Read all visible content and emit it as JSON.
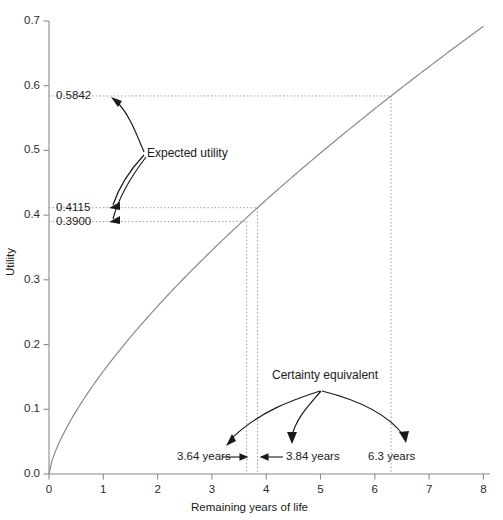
{
  "chart_data": {
    "type": "line",
    "title": "",
    "xlabel": "Remaining years of life",
    "ylabel": "Utility",
    "xlim": [
      0,
      8
    ],
    "ylim": [
      0,
      0.7
    ],
    "grid": false,
    "legend": "none",
    "xticks": [
      "0",
      "1",
      "2",
      "3",
      "4",
      "5",
      "6",
      "7",
      "8"
    ],
    "xtick_values": [
      0,
      1,
      2,
      3,
      4,
      5,
      6,
      7,
      8
    ],
    "yticks": [
      "0.0",
      "0.1",
      "0.2",
      "0.3",
      "0.4",
      "0.5",
      "0.6",
      "0.7"
    ],
    "ytick_values": [
      0.0,
      0.1,
      0.2,
      0.3,
      0.4,
      0.5,
      0.6,
      0.7
    ],
    "series": [
      {
        "name": "Utility curve",
        "x": [
          0.0,
          0.25,
          0.5,
          0.75,
          1.0,
          1.5,
          2.0,
          2.5,
          3.0,
          3.5,
          3.64,
          3.84,
          4.0,
          4.5,
          5.0,
          5.5,
          6.0,
          6.3,
          6.5,
          7.0,
          7.5,
          8.0
        ],
        "y": [
          0.0,
          0.0185,
          0.0365,
          0.054,
          0.071,
          0.1035,
          0.1345,
          0.164,
          0.1925,
          0.22,
          0.39,
          0.4115,
          0.246,
          0.2715,
          0.296,
          0.32,
          0.343,
          0.5842,
          0.3655,
          0.3875,
          0.4085,
          0.429
        ]
      }
    ],
    "reference_values": [
      {
        "label": "0.5842",
        "utility": 0.5842,
        "years": 6.3
      },
      {
        "label": "0.4115",
        "utility": 0.4115,
        "years": 3.84
      },
      {
        "label": "0.3900",
        "utility": 0.39,
        "years": 3.64
      }
    ],
    "certainty_equivalents": [
      {
        "label": "3.64 years",
        "value": 3.64
      },
      {
        "label": "3.84 years",
        "value": 3.84
      },
      {
        "label": "6.3 years",
        "value": 6.3
      }
    ],
    "annotations": [
      {
        "label": "Expected utility",
        "targets": [
          0.5842,
          0.4115,
          0.39
        ]
      },
      {
        "label": "Certainty equivalent",
        "targets": [
          3.64,
          3.84,
          6.3
        ]
      }
    ],
    "colors": {
      "curve": "#8a8a8a",
      "axis": "#8a8a8a",
      "guide": "#9a9a9a",
      "annotation": "#1a1a1a",
      "text": "#1a1a1a",
      "background": "#ffffff"
    }
  },
  "axes": {
    "y_title": "Utility",
    "x_title": "Remaining years of life",
    "y_tick_labels": [
      "0.7",
      "0.6",
      "0.5",
      "0.4",
      "0.3",
      "0.2",
      "0.1",
      "0.0"
    ],
    "x_tick_labels": [
      "0",
      "1",
      "2",
      "3",
      "4",
      "5",
      "6",
      "7",
      "8"
    ]
  },
  "value_labels": {
    "upper": "0.5842",
    "middle": "0.4115",
    "lower": "0.3900"
  },
  "annotations": {
    "expected_utility": "Expected utility",
    "certainty_equivalent": "Certainty equivalent",
    "ce_left": "3.64 years",
    "ce_middle": "3.84 years",
    "ce_right": "6.3 years"
  }
}
